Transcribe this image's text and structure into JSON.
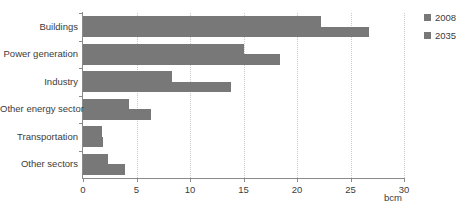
{
  "chart_data": {
    "type": "bar",
    "orientation": "horizontal",
    "title": "in the New Policies Scenario",
    "xlabel": "bcm",
    "ylabel": "",
    "xlim": [
      0,
      30
    ],
    "xticks": [
      0,
      5,
      10,
      15,
      20,
      25,
      30
    ],
    "xtick_labels": [
      "0",
      "5",
      "10",
      "15",
      "20",
      "25",
      "30"
    ],
    "grid": "vertical-dotted",
    "legend_position": "right-top",
    "categories": [
      "Buildings",
      "Power generation",
      "Industry",
      "Other energy sector",
      "Transportation",
      "Other sectors"
    ],
    "series": [
      {
        "name": "2008",
        "color": "#787878",
        "values": [
          22.2,
          15.0,
          8.3,
          4.3,
          1.8,
          2.3
        ]
      },
      {
        "name": "2035",
        "color": "#787878",
        "values": [
          26.7,
          18.4,
          13.8,
          6.4,
          1.9,
          3.9
        ]
      }
    ]
  },
  "legend": {
    "items": [
      {
        "label": "2008",
        "color": "#787878"
      },
      {
        "label": "2035",
        "color": "#787878"
      }
    ]
  },
  "axis": {
    "unit_label": "bcm"
  }
}
